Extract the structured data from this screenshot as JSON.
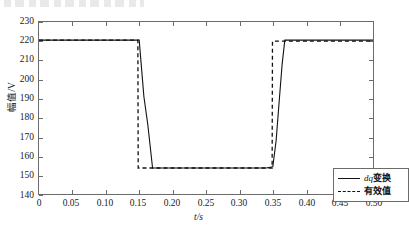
{
  "chart_data": {
    "type": "line",
    "title": "",
    "xlabel": "t/s",
    "ylabel": "幅值/V",
    "xlim": [
      0,
      0.5
    ],
    "ylim": [
      140,
      230
    ],
    "xticks": [
      "0",
      "0.05",
      "0.10",
      "0.15",
      "0.20",
      "0.25",
      "0.30",
      "0.35",
      "0.40",
      "0.45",
      "0.50"
    ],
    "xtick_values": [
      0,
      0.05,
      0.1,
      0.15,
      0.2,
      0.25,
      0.3,
      0.35,
      0.4,
      0.45,
      0.5
    ],
    "yticks": [
      "140",
      "150",
      "160",
      "170",
      "180",
      "190",
      "200",
      "210",
      "220",
      "230"
    ],
    "ytick_values": [
      140,
      150,
      160,
      170,
      180,
      190,
      200,
      210,
      220,
      230
    ],
    "grid": false,
    "legend_position": "lower-right",
    "series": [
      {
        "name": "dq变换",
        "style": "solid",
        "color": "#111111",
        "x": [
          0.0,
          0.05,
          0.1,
          0.145,
          0.15,
          0.157,
          0.163,
          0.17,
          0.2,
          0.25,
          0.3,
          0.34,
          0.35,
          0.355,
          0.36,
          0.364,
          0.368,
          0.4,
          0.45,
          0.5
        ],
        "y": [
          220.5,
          220.5,
          220.5,
          220.5,
          220.5,
          191.0,
          176.0,
          153.6,
          153.6,
          153.6,
          153.6,
          153.6,
          154.2,
          168.0,
          190.5,
          208.0,
          220.5,
          220.5,
          220.5,
          220.5
        ]
      },
      {
        "name": "有效值",
        "style": "dashed",
        "color": "#111111",
        "x": [
          0.0,
          0.05,
          0.1,
          0.148,
          0.1485,
          0.2,
          0.25,
          0.3,
          0.349,
          0.3495,
          0.4,
          0.45,
          0.5
        ],
        "y": [
          220.5,
          220.5,
          220.5,
          220.5,
          153.6,
          153.6,
          153.6,
          153.6,
          153.6,
          220.0,
          220.0,
          220.0,
          220.0
        ]
      }
    ],
    "annotations": {
      "nominal_voltage": 220.5,
      "sag_voltage": 153.6,
      "sag_start_s": 0.15,
      "sag_end_s": 0.35
    }
  },
  "legend": {
    "items": [
      {
        "label_prefix": "dq",
        "label_suffix": "变换",
        "style": "solid"
      },
      {
        "label_prefix": "",
        "label_suffix": "有效值",
        "style": "dashed"
      }
    ]
  }
}
